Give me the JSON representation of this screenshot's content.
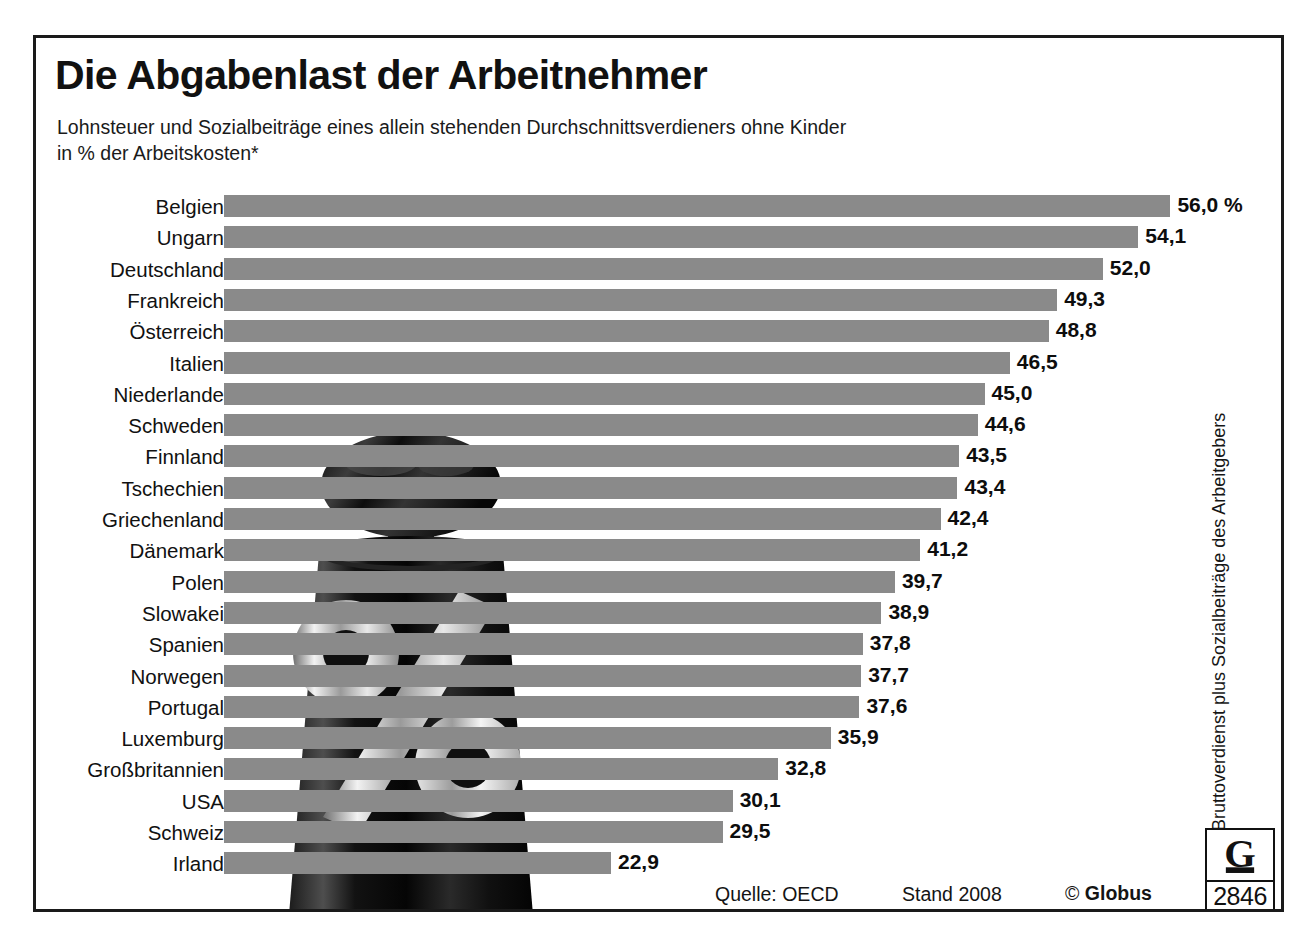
{
  "header": {
    "title": "Die Abgabenlast der Arbeitnehmer",
    "subtitle_line1": "Lohnsteuer und Sozialbeiträge eines allein stehenden Durchschnittsverdieners ohne Kinder",
    "subtitle_line2": "in % der Arbeitskosten*"
  },
  "footnote_vertical": "*Bruttoverdienst plus Sozialbeiträge des Arbeitgebers",
  "footer": {
    "source": "Quelle: OECD",
    "stand": "Stand 2008",
    "copyright_symbol": "©",
    "copyright_brand": "Globus"
  },
  "logo": {
    "mark": "globus-G-on-stand",
    "number": "2846"
  },
  "colors": {
    "bar": "#8a8a8a",
    "text": "#111111",
    "frame": "#1a1a1a",
    "background": "#ffffff"
  },
  "chart_data": {
    "type": "bar",
    "orientation": "horizontal",
    "title": "Die Abgabenlast der Arbeitnehmer",
    "subtitle": "Lohnsteuer und Sozialbeiträge eines allein stehenden Durchschnittsverdieners ohne Kinder in % der Arbeitskosten*",
    "xlabel": "",
    "ylabel": "",
    "unit": "%",
    "unit_suffix_first_row": "56,0 %",
    "grid": false,
    "legend": false,
    "xlim": [
      0,
      56
    ],
    "categories": [
      "Belgien",
      "Ungarn",
      "Deutschland",
      "Frankreich",
      "Österreich",
      "Italien",
      "Niederlande",
      "Schweden",
      "Finnland",
      "Tschechien",
      "Griechenland",
      "Dänemark",
      "Polen",
      "Slowakei",
      "Spanien",
      "Norwegen",
      "Portugal",
      "Luxemburg",
      "Großbritannien",
      "USA",
      "Schweiz",
      "Irland"
    ],
    "values": [
      56.0,
      54.1,
      52.0,
      49.3,
      48.8,
      46.5,
      45.0,
      44.6,
      43.5,
      43.4,
      42.4,
      41.2,
      39.7,
      38.9,
      37.8,
      37.7,
      37.6,
      35.9,
      32.8,
      30.1,
      29.5,
      22.9
    ],
    "value_labels": [
      "56,0 %",
      "54,1",
      "52,0",
      "49,3",
      "48,8",
      "46,5",
      "45,0",
      "44,6",
      "43,5",
      "43,4",
      "42,4",
      "41,2",
      "39,7",
      "38,9",
      "37,8",
      "37,7",
      "37,6",
      "35,9",
      "32,8",
      "30,1",
      "29,5",
      "22,9"
    ]
  }
}
